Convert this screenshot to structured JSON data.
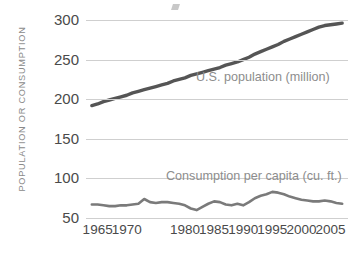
{
  "chart_data": {
    "type": "line",
    "title": "",
    "subtitle": "",
    "xlabel": "",
    "ylabel": "POPULATION OR CONSUMPTION",
    "xlim": [
      1963,
      2008
    ],
    "ylim": [
      50,
      300
    ],
    "grid": true,
    "legend_position": "inline-right",
    "y_ticks": [
      300,
      250,
      200,
      150,
      100,
      50
    ],
    "y_tick_labels": [
      "300",
      "250",
      "200",
      "150",
      "100",
      "50"
    ],
    "x_ticks": [
      1965,
      1970,
      1980,
      1985,
      1990,
      1995,
      2000,
      2005
    ],
    "x_tick_labels": [
      "1965",
      "1970",
      "1980",
      "1985",
      "1990",
      "1995",
      "2000",
      "2005"
    ],
    "x": [
      1964,
      1965,
      1966,
      1967,
      1968,
      1969,
      1970,
      1971,
      1972,
      1973,
      1974,
      1975,
      1976,
      1977,
      1978,
      1979,
      1980,
      1981,
      1982,
      1983,
      1984,
      1985,
      1986,
      1987,
      1988,
      1989,
      1990,
      1991,
      1992,
      1993,
      1994,
      1995,
      1996,
      1997,
      1998,
      1999,
      2000,
      2001,
      2002,
      2003,
      2004,
      2005,
      2006,
      2007
    ],
    "series": [
      {
        "name": "U.S. population (million)",
        "color": "#555555",
        "unit": "million",
        "values": [
          192,
          194,
          197,
          199,
          201,
          203,
          205,
          208,
          210,
          212,
          214,
          216,
          218,
          220,
          223,
          225,
          227,
          230,
          232,
          234,
          236,
          238,
          240,
          243,
          245,
          247,
          250,
          253,
          257,
          260,
          263,
          266,
          269,
          273,
          276,
          279,
          282,
          285,
          288,
          291,
          293,
          294,
          295,
          296
        ]
      },
      {
        "name": "Consumption per capita (cu. ft.)",
        "color": "#7a7a7a",
        "unit": "cu. ft.",
        "values": [
          67,
          67,
          66,
          65,
          65,
          66,
          66,
          67,
          68,
          74,
          70,
          69,
          70,
          70,
          69,
          68,
          66,
          62,
          60,
          64,
          68,
          71,
          70,
          67,
          66,
          68,
          66,
          70,
          75,
          78,
          80,
          83,
          82,
          80,
          77,
          75,
          73,
          72,
          71,
          71,
          72,
          71,
          69,
          68
        ]
      }
    ],
    "annotations": [
      {
        "text": "U.S. population (million)",
        "series": "U.S. population (million)"
      },
      {
        "text": "Consumption per capita (cu. ft.)",
        "series": "Consumption per capita (cu. ft.)"
      }
    ]
  }
}
